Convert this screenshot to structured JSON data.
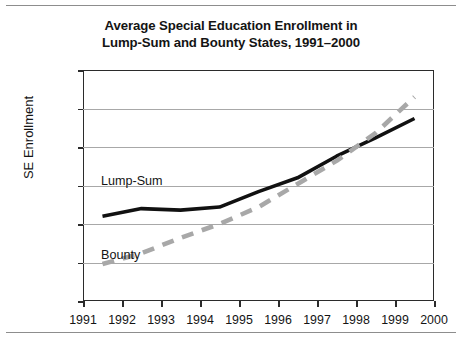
{
  "chart_data": {
    "type": "line",
    "title": "Average Special Education Enrollment in Lump-Sum and Bounty States, 1991–2000",
    "title_line1": "Average Special Education Enrollment in",
    "title_line2": "Lump-Sum and Bounty States, 1991–2000",
    "xlabel": "",
    "ylabel": "SE Enrollment",
    "xlim": [
      1991,
      2000
    ],
    "ylim": [
      10.0,
      13.0
    ],
    "grid": true,
    "legend_position": "inline-annotation",
    "x_tick_labels": [
      "1991",
      "1992",
      "1993",
      "1994",
      "1995",
      "1996",
      "1997",
      "1998",
      "1999",
      "2000"
    ],
    "y_tick_labels": [
      "10.0%",
      "10.5%",
      "11.0%",
      "11.5%",
      "12.0%",
      "12.5%",
      "13.0%"
    ],
    "y_tick_values": [
      10.0,
      10.5,
      11.0,
      11.5,
      12.0,
      12.5,
      13.0
    ],
    "x": [
      1991.5,
      1992.5,
      1993.5,
      1994.5,
      1995.5,
      1996.5,
      1997.5,
      1998.5,
      1999.5
    ],
    "series": [
      {
        "name": "Lump-Sum",
        "style": "solid",
        "color": "#111111",
        "values": [
          11.1,
          11.2,
          11.18,
          11.22,
          11.42,
          11.6,
          11.88,
          12.12,
          12.37
        ]
      },
      {
        "name": "Bounty",
        "style": "dashed",
        "color": "#a8a8a8",
        "values": [
          10.48,
          10.62,
          10.82,
          11.0,
          11.22,
          11.52,
          11.82,
          12.18,
          12.65
        ]
      }
    ]
  },
  "colors": {
    "lump_sum": "#111111",
    "bounty": "#a8a8a8",
    "grid": "#a8a8a8",
    "frame": "#2b2b2b",
    "rule": "#8d8d8d",
    "text": "#141414"
  }
}
